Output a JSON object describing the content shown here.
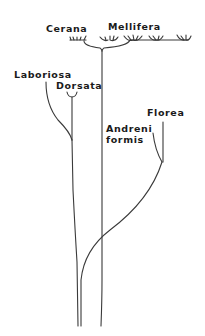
{
  "diagram": {
    "type": "phylogenetic-tree",
    "stroke_color": "#3a3a3a",
    "text_color": "#1a1a1a",
    "labels": {
      "cerana": "Cerana",
      "mellifera": "Mellifera",
      "laboriosa": "Laboriosa",
      "dorsata": "Dorsata",
      "andreniformis_line1": "Andreni",
      "andreniformis_line2": "formis",
      "florea": "Florea"
    }
  }
}
